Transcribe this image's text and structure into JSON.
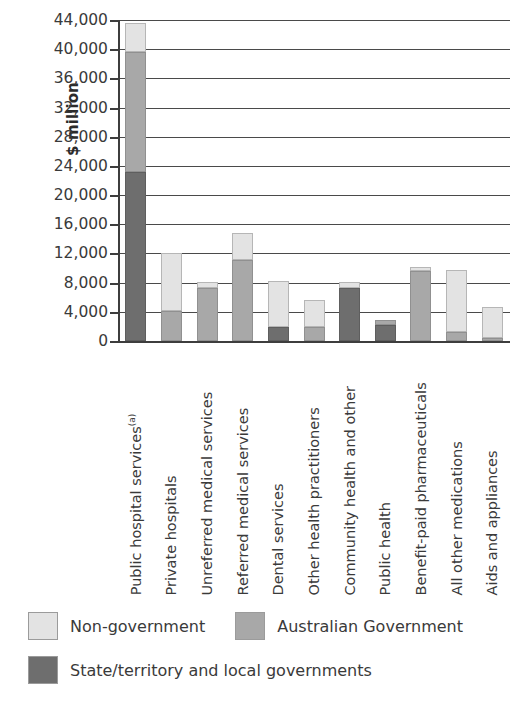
{
  "chart_data": {
    "type": "bar",
    "subtype": "stacked-vertical",
    "title": "",
    "xlabel": "",
    "ylabel": "$ million",
    "ylim": [
      0,
      44000
    ],
    "ytick_step": 4000,
    "ytick_labels": [
      "44,000",
      "40,000",
      "36,000",
      "32,000",
      "28,000",
      "24,000",
      "20,000",
      "16,000",
      "12,000",
      "8,000",
      "4,000",
      "0"
    ],
    "ytick_values": [
      44000,
      40000,
      36000,
      32000,
      28000,
      24000,
      20000,
      16000,
      12000,
      8000,
      4000,
      0
    ],
    "grid": "horizontal",
    "legend_position": "below",
    "categories": [
      "Public hospital services",
      "Private hospitals",
      "Unreferred medical services",
      "Referred medical services",
      "Dental services",
      "Other health practitioners",
      "Community health and other",
      "Public health",
      "Benefit-paid pharmaceuticals",
      "All other medications",
      "Aids and appliances"
    ],
    "category_footnotes": [
      "(a)",
      "",
      "",
      "",
      "",
      "",
      "",
      "",
      "",
      "",
      ""
    ],
    "series": [
      {
        "name": "State/territory and local governments",
        "color": "#6e6e6e",
        "values": [
          23200,
          0,
          0,
          0,
          1900,
          0,
          7300,
          2200,
          0,
          0,
          0
        ]
      },
      {
        "name": "Australian Government",
        "color": "#a8a8a8",
        "values": [
          16400,
          4100,
          7300,
          11100,
          0,
          1900,
          0,
          700,
          9600,
          1300,
          400
        ]
      },
      {
        "name": "Non-government",
        "color": "#e3e3e3",
        "values": [
          4000,
          8000,
          800,
          3700,
          6300,
          3700,
          800,
          0,
          600,
          8500,
          4200
        ]
      }
    ],
    "totals": [
      43600,
      12100,
      8100,
      14800,
      8200,
      5600,
      8100,
      2900,
      10200,
      9800,
      4600
    ]
  },
  "axis": {
    "y_title": "$ million"
  },
  "legend": {
    "entries": [
      {
        "label": "Non-government",
        "swatch": "#e3e3e3"
      },
      {
        "label": "Australian Government",
        "swatch": "#a8a8a8"
      },
      {
        "label": "State/territory and local governments",
        "swatch": "#6e6e6e"
      }
    ]
  }
}
